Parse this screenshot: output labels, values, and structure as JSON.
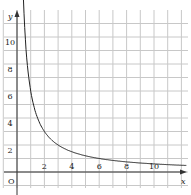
{
  "chart_data": {
    "type": "line",
    "title": "",
    "xlabel": "x",
    "ylabel": "y",
    "origin_label": "O",
    "x_ticks": [
      "2",
      "4",
      "6",
      "8",
      "10"
    ],
    "y_ticks": [
      "2",
      "4",
      "6",
      "8",
      "10"
    ],
    "xlim": [
      0,
      12
    ],
    "ylim": [
      0,
      11
    ],
    "grid": true,
    "series": [
      {
        "name": "y = 6/x",
        "x": [
          0.5,
          0.75,
          1,
          1.5,
          2,
          3,
          4,
          5,
          6,
          8,
          10,
          12
        ],
        "y": [
          12,
          8,
          6,
          4,
          3,
          2,
          1.5,
          1.2,
          1,
          0.75,
          0.6,
          0.5
        ]
      }
    ]
  }
}
